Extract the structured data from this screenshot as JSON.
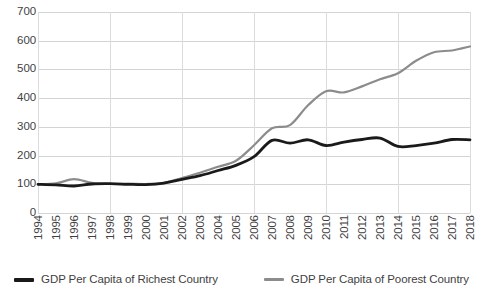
{
  "chart_data": {
    "type": "line",
    "title": "",
    "xlabel": "",
    "ylabel": "",
    "ylim": [
      0,
      700
    ],
    "ytick_step": 100,
    "yticks": [
      700,
      600,
      500,
      400,
      300,
      200,
      100,
      0
    ],
    "grid": true,
    "legend_position": "bottom",
    "categories": [
      "1994",
      "1995",
      "1996",
      "1997",
      "1998",
      "1999",
      "2000",
      "2001",
      "2002",
      "2003",
      "2004",
      "2005",
      "2006",
      "2007",
      "2008",
      "2009",
      "2010",
      "2011",
      "2012",
      "2013",
      "2014",
      "2015",
      "2016",
      "2017",
      "2018"
    ],
    "series": [
      {
        "name": "GDP Per Capita of Richest Country",
        "color": "#1a1a1a",
        "values": [
          100,
          98,
          94,
          101,
          102,
          100,
          99,
          104,
          117,
          130,
          148,
          166,
          196,
          253,
          243,
          255,
          235,
          247,
          256,
          261,
          232,
          235,
          243,
          256,
          255
        ]
      },
      {
        "name": "GDP Per Capita of Poorest Country",
        "color": "#8c8c8c",
        "values": [
          100,
          103,
          118,
          105,
          101,
          102,
          101,
          105,
          122,
          140,
          161,
          182,
          236,
          295,
          306,
          375,
          424,
          420,
          441,
          466,
          487,
          530,
          560,
          566,
          580
        ]
      }
    ]
  }
}
